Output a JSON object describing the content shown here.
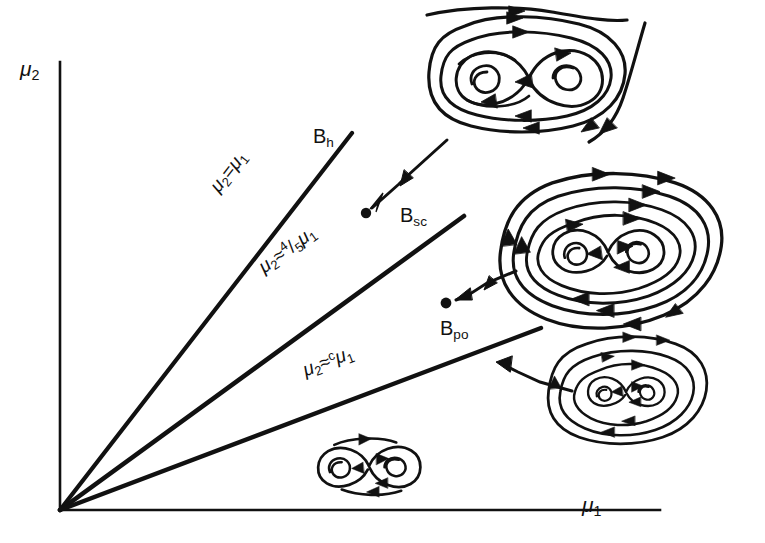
{
  "figure": {
    "kind": "bifurcation-diagram",
    "background_color": "#ffffff",
    "ink_color": "#111111",
    "width": 765,
    "height": 543
  },
  "axes": {
    "x_label": "μ",
    "x_label_sub": "1",
    "y_label": "μ",
    "y_label_sub": "2",
    "origin": {
      "x": 60,
      "y": 510
    },
    "x_end": {
      "x": 660,
      "y": 510
    },
    "y_end": {
      "x": 60,
      "y": 62
    }
  },
  "branches": [
    {
      "id": "bh",
      "label_base": "B",
      "label_sub": "h",
      "equation_lhs": "μ",
      "equation_lhs_sub": "2",
      "equation_rel": "=",
      "equation_rhs": "μ",
      "equation_rhs_sub": "1",
      "equation_coefficient": "",
      "from": {
        "x": 60,
        "y": 510
      },
      "to": {
        "x": 352,
        "y": 133
      },
      "label_pos": {
        "x": 315,
        "y": 128
      },
      "equation_pos": {
        "x": 228,
        "y": 182
      }
    },
    {
      "id": "bsc",
      "label_base": "B",
      "label_sub": "sc",
      "equation_lhs": "μ",
      "equation_lhs_sub": "2",
      "equation_rel": "≈",
      "equation_rhs": "μ",
      "equation_rhs_sub": "1",
      "equation_coefficient": "4/5",
      "equation_numerator": "4",
      "equation_denominator": "5",
      "from": {
        "x": 60,
        "y": 510
      },
      "to": {
        "x": 464,
        "y": 216
      },
      "label_pos": {
        "x": 403,
        "y": 207
      },
      "equation_pos": {
        "x": 272,
        "y": 258
      }
    },
    {
      "id": "bpo",
      "label_base": "B",
      "label_sub": "po",
      "equation_lhs": "μ",
      "equation_lhs_sub": "2",
      "equation_rel": "≈",
      "equation_rhs": "μ",
      "equation_rhs_sub": "1",
      "equation_coefficient": "c",
      "from": {
        "x": 60,
        "y": 510
      },
      "to": {
        "x": 541,
        "y": 328
      },
      "label_pos": {
        "x": 444,
        "y": 320
      },
      "equation_pos": {
        "x": 312,
        "y": 362
      }
    }
  ],
  "insets": [
    {
      "id": "inset-top",
      "name": "phase-portrait-above-bh",
      "description": "figure-eight with two spiral foci, nested closed orbits and outer open streamlines",
      "center": {
        "x": 527,
        "y": 78
      },
      "scale": 1.0,
      "has_outer_open_orbits": true,
      "has_outer_closed_orbits": true,
      "inner_loops": 2,
      "pointer": {
        "from": {
          "x": 447,
          "y": 140
        },
        "to": {
          "x": 369,
          "y": 210
        },
        "dot": {
          "x": 366,
          "y": 213
        }
      }
    },
    {
      "id": "inset-middle",
      "name": "phase-portrait-between-bh-bsc",
      "description": "figure-eight core surrounded by several nested closed orbits",
      "center": {
        "x": 608,
        "y": 252
      },
      "scale": 0.95,
      "has_outer_open_orbits": false,
      "has_outer_closed_orbits": true,
      "inner_loops": 2,
      "pointer": {
        "from": {
          "x": 515,
          "y": 272
        },
        "to": {
          "x": 452,
          "y": 300
        },
        "dot": {
          "x": 446,
          "y": 303
        }
      }
    },
    {
      "id": "inset-lower-right",
      "name": "phase-portrait-between-bsc-bpo",
      "description": "small figure-eight core with two surrounding closed orbits",
      "center": {
        "x": 624,
        "y": 392
      },
      "scale": 0.72,
      "has_outer_open_orbits": false,
      "has_outer_closed_orbits": true,
      "inner_loops": 2,
      "pointer": {
        "from": {
          "x": 570,
          "y": 390
        },
        "to": {
          "x": 499,
          "y": 362
        },
        "dot": null
      }
    },
    {
      "id": "inset-bottom",
      "name": "phase-portrait-below-bpo",
      "description": "bare figure-eight homoclinic loop with two spiral foci",
      "center": {
        "x": 369,
        "y": 466
      },
      "scale": 0.52,
      "has_outer_open_orbits": false,
      "has_outer_closed_orbits": false,
      "inner_loops": 2,
      "pointer": null
    }
  ]
}
